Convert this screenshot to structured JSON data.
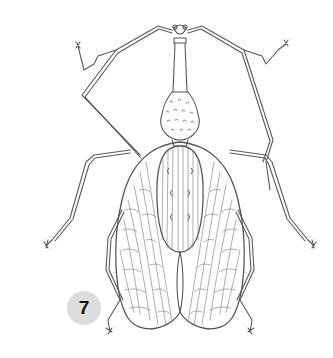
{
  "figure": {
    "style": "pencil line drawing",
    "label_number": "7",
    "colors": {
      "background": "#ffffff",
      "stroke": "#555555",
      "badge_fill": "#dcdcdc",
      "badge_text": "#111111"
    }
  }
}
